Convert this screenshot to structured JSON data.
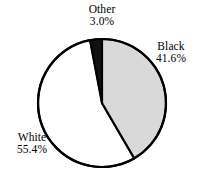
{
  "chart_data": {
    "type": "pie",
    "title": "",
    "subtitle": "",
    "xlabel": "",
    "ylabel": "",
    "grid": false,
    "legend": "none",
    "label_style": "outside-callout",
    "units": "percent",
    "start_angle_deg": 0,
    "direction": "clockwise",
    "categories": [
      "Black",
      "White",
      "Other"
    ],
    "values": [
      41.6,
      55.4,
      3.0
    ],
    "slices": [
      {
        "name": "Black",
        "value": 41.6,
        "value_text": "41.6%",
        "color": "#d9d9d9",
        "start_deg": 0.0,
        "end_deg": 149.76
      },
      {
        "name": "White",
        "value": 55.4,
        "value_text": "55.4%",
        "color": "#ffffff",
        "start_deg": 149.76,
        "end_deg": 349.2
      },
      {
        "name": "Other",
        "value": 3.0,
        "value_text": "3.0%",
        "color": "#111111",
        "start_deg": 349.2,
        "end_deg": 360.0
      }
    ],
    "annotations": [
      {
        "name": "Other",
        "value_text": "3.0%",
        "placement": "top"
      },
      {
        "name": "Black",
        "value_text": "41.6%",
        "placement": "right"
      },
      {
        "name": "White",
        "value_text": "55.4%",
        "placement": "left"
      }
    ],
    "geometry": {
      "center_x": 102,
      "center_y": 103,
      "radius": 64,
      "stroke_color": "#000000",
      "stroke_width": 2.2
    }
  },
  "labels": {
    "other": {
      "name": "Other",
      "value": "3.0%"
    },
    "black": {
      "name": "Black",
      "value": "41.6%"
    },
    "white": {
      "name": "White",
      "value": "55.4%"
    }
  }
}
